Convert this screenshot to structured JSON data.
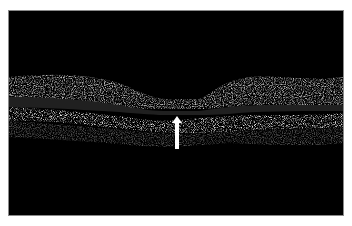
{
  "image": {
    "type": "OCT retinal cross-section",
    "description": "Grayscale optical coherence tomography B-scan showing retinal layers with a central foveal depression; white arrow points up at the foveal center",
    "background_color": "#000000",
    "layer_color": "#d8d8d8",
    "annotation": {
      "shape": "arrow",
      "direction": "up",
      "color": "#ffffff",
      "position_px": {
        "x": 176,
        "tip_y": 117,
        "tail_y": 147
      }
    }
  }
}
